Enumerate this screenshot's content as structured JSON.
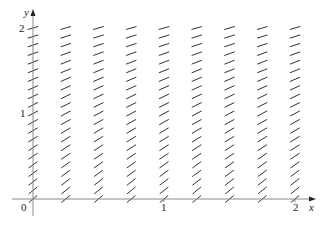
{
  "figure": {
    "type": "direction-field",
    "axis_labels": {
      "x": "x",
      "y": "y"
    },
    "x_ticks": [
      "0",
      "1",
      "2"
    ],
    "y_ticks": [
      "1",
      "2"
    ],
    "origin_label": "0",
    "x_range": [
      0,
      2
    ],
    "y_range": [
      0,
      2
    ],
    "x_samples": [
      0,
      0.25,
      0.5,
      0.75,
      1,
      1.25,
      1.5,
      1.75,
      2
    ],
    "y_step": 0.1,
    "segment_color": "#333333",
    "axis_color": "#888888"
  }
}
